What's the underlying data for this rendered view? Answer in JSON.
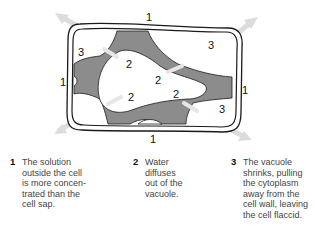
{
  "diagram": {
    "colors": {
      "cytoplasm": "#8c8c8c",
      "outline": "#1a1a1a",
      "arrow": "#d8d8d8",
      "background": "#ffffff"
    },
    "labels": [
      {
        "id": "wall-top",
        "text": "1",
        "x": 149,
        "y": 20
      },
      {
        "id": "wall-left",
        "text": "1",
        "x": 60,
        "y": 86
      },
      {
        "id": "wall-right",
        "text": "1",
        "x": 243,
        "y": 94
      },
      {
        "id": "wall-bottom",
        "text": "1",
        "x": 150,
        "y": 142
      },
      {
        "id": "gap-top-left",
        "text": "3",
        "x": 79,
        "y": 56
      },
      {
        "id": "gap-top-right",
        "text": "3",
        "x": 208,
        "y": 49
      },
      {
        "id": "gap-bottom-right",
        "text": "3",
        "x": 219,
        "y": 113
      },
      {
        "id": "vacuole-upper-left",
        "text": "2",
        "x": 126,
        "y": 68
      },
      {
        "id": "vacuole-center",
        "text": "2",
        "x": 155,
        "y": 83
      },
      {
        "id": "vacuole-lower-left",
        "text": "2",
        "x": 127,
        "y": 101
      },
      {
        "id": "vacuole-lower-right",
        "text": "2",
        "x": 173,
        "y": 98
      }
    ]
  },
  "legend": [
    {
      "number": "1",
      "text": "The solution\noutside the cell\nis more concen-\ntrated than the\ncell sap."
    },
    {
      "number": "2",
      "text": "Water\ndiffuses\nout of the\nvacuole."
    },
    {
      "number": "3",
      "text": "The vacuole\nshrinks, pulling\nthe cytoplasm\naway from the\ncell wall, leaving\nthe cell flaccid."
    }
  ]
}
